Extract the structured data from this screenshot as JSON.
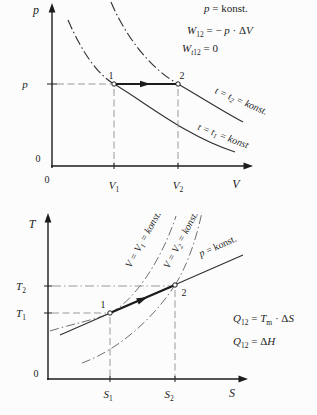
{
  "figure_title": "isobaric process in p-V and T-S diagrams",
  "colors": {
    "ink": "#1c1c1c",
    "curve": "#2f2f2f",
    "guide": "#8f8f8f",
    "isochore": "#6e6e6e",
    "background": "#fcfcfc"
  },
  "pv": {
    "axis_y": "p",
    "axis_x": "V",
    "zero_y": "0",
    "zero_x": "0",
    "tick_p": "p",
    "point1": "1",
    "point2": "2",
    "x_tick1": {
      "base": "V",
      "sub": "1"
    },
    "x_tick2": {
      "base": "V",
      "sub": "2"
    },
    "isotherm2": {
      "pre": "t = t",
      "sub": "2",
      "post": " = konst."
    },
    "isotherm1": {
      "pre": "t = t",
      "sub": "1",
      "post": " = konst"
    },
    "eq1": {
      "v1": "p",
      "r1": " = konst."
    },
    "eq2": {
      "v1": "W",
      "s1": "12",
      "r1": " = − ",
      "v2": "p",
      "r2": " · Δ",
      "v3": "V"
    },
    "eq3": {
      "v1": "W",
      "s1a": "t",
      "s1b": "12",
      "r1": " = 0"
    }
  },
  "ts": {
    "axis_y": "T",
    "axis_x": "S",
    "zero": "0",
    "tick_t2": {
      "base": "T",
      "sub": "2"
    },
    "tick_t1": {
      "base": "T",
      "sub": "1"
    },
    "point1": "1",
    "point2": "2",
    "x_tick1": {
      "base": "S",
      "sub": "1"
    },
    "x_tick2": {
      "base": "S",
      "sub": "2"
    },
    "isochore1": {
      "pre": "V = V",
      "sub": "1",
      "post": " = konst."
    },
    "isochore2": {
      "pre": "V = V",
      "sub": "2",
      "post": " = konst."
    },
    "isobar": {
      "v1": "p",
      "r1": " = konst."
    },
    "eq1": {
      "v1": "Q",
      "s1": "12",
      "r1": " = ",
      "v2": "T",
      "s2": "m",
      "r2": " · Δ",
      "v3": "S"
    },
    "eq2": {
      "v1": "Q",
      "s1": "12",
      "r1": " = Δ",
      "v2": "H"
    }
  }
}
